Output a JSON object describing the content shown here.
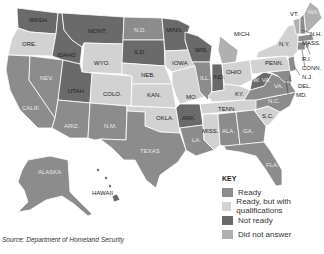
{
  "colors": {
    "ready": "#8c8c8c",
    "ready_qualified": "#d2d2d2",
    "not_ready": "#6a6a6a",
    "did_not_answer": "#b0b0b0"
  },
  "legend": {
    "title": "KEY",
    "items": [
      {
        "label": "Ready",
        "color": "#8c8c8c"
      },
      {
        "label": "Ready, but with qualifications",
        "color": "#d2d2d2"
      },
      {
        "label": "Not ready",
        "color": "#6a6a6a"
      },
      {
        "label": "Did not answer",
        "color": "#b0b0b0"
      }
    ]
  },
  "source": "Source: Department of Homeland Security",
  "states": {
    "wash": "WASH.",
    "ore": "ORE.",
    "calif": "CALIF.",
    "nev": "NEV.",
    "idaho": "IDAHO",
    "mont": "MONT.",
    "wyo": "WYO.",
    "utah": "UTAH",
    "colo": "COLO.",
    "ariz": "ARIZ.",
    "nm": "N.M.",
    "nd": "N.D.",
    "sd": "S.D.",
    "neb": "NEB.",
    "kan": "KAN.",
    "okla": "OKLA.",
    "texas": "TEXAS",
    "minn": "MINN.",
    "iowa": "IOWA",
    "mo": "MO.",
    "ark": "ARK.",
    "la": "LA.",
    "wis": "WIS.",
    "ill": "ILL.",
    "mich": "MICH.",
    "ind": "IND.",
    "ohio": "OHIO",
    "ky": "KY.",
    "tenn": "TENN.",
    "miss": "MISS.",
    "ala": "ALA.",
    "ga": "GA.",
    "fla": "FLA.",
    "sc": "S.C.",
    "nc": "N.C.",
    "va": "VA.",
    "wva": "W. VA.",
    "penn": "PENN.",
    "ny": "N.Y.",
    "vt": "VT.",
    "nh": "N.H.",
    "me": "MA.",
    "mass": "MASS.",
    "ri": "R.I.",
    "conn": "CONN.",
    "nj": "N.J.",
    "del": "DEL.",
    "md": "MD.",
    "alaska": "ALASKA",
    "hawaii": "HAWAII"
  }
}
